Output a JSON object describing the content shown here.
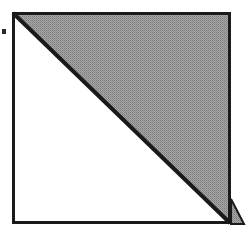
{
  "document": {
    "kind": "scanned-geometry-figure",
    "width": 251,
    "height": 239,
    "background_color": "#ffffff",
    "title": "Square divided by a diagonal with upper-right half shaded"
  },
  "colors": {
    "stroke": "#1a1a1a",
    "shade_fill": "#9a9a9a",
    "shade_dither_dark": "#777777",
    "shade_dither_light": "#bdbdbd",
    "page_background": "#ffffff",
    "unshaded_fill": "#ffffff"
  },
  "figure": {
    "square": {
      "label": "outer-square",
      "left": 12,
      "top": 12,
      "right": 231,
      "bottom": 224,
      "width": 219,
      "height": 212,
      "stroke_width": 3,
      "fill": "#ffffff"
    },
    "diagonal": {
      "label": "main-diagonal",
      "from_x": 13,
      "from_y": 13,
      "to_x": 230,
      "to_y": 223,
      "stroke_width": 4,
      "direction": "top-left to bottom-right"
    },
    "shaded_region": {
      "label": "upper-right-half",
      "shape": "triangle",
      "points": "13,13 230,13 230,223",
      "fill_description": "dithered halftone gray",
      "fill": "#9a9a9a"
    },
    "unshaded_region": {
      "label": "lower-left-half",
      "shape": "triangle",
      "points": "13,13 13,223 230,223",
      "fill": "#ffffff"
    },
    "corner_flap": {
      "label": "bottom-right-flap",
      "shape": "triangle",
      "points": "232,200 232,224 243,224",
      "fill": "#9a9a9a",
      "stroke_width": 2
    },
    "margin_mark": {
      "label": "left-margin-dot",
      "x": 2,
      "y": 29,
      "width": 4,
      "height": 5,
      "fill": "#2a2a2a"
    }
  }
}
